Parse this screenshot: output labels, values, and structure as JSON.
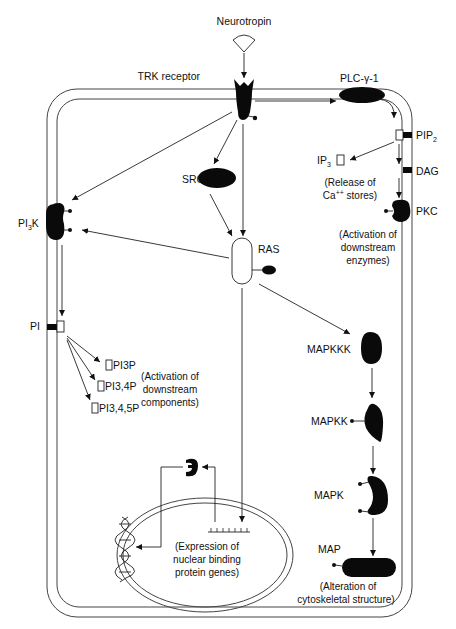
{
  "diagram": {
    "ligand": {
      "label": "Neurotropin"
    },
    "receptor": {
      "label": "TRK receptor"
    },
    "plc": {
      "label": "PLC-γ-1"
    },
    "pip2": {
      "label": "PIP",
      "sub": "2"
    },
    "ip3": {
      "label": "IP",
      "sub": "3"
    },
    "dag": {
      "label": "DAG"
    },
    "pkc": {
      "label": "PKC"
    },
    "ca_note": {
      "line1": "(Release of",
      "line2": "Ca",
      "sup": "++",
      "line2b": " stores)"
    },
    "pkc_note": {
      "line1": "(Activation of",
      "line2": "downstream",
      "line3": "enzymes)"
    },
    "src": {
      "label": "SRC"
    },
    "ras": {
      "label": "RAS"
    },
    "pi3k": {
      "label": "PI",
      "sub": "3",
      "label2": "K"
    },
    "pi": {
      "label": "PI"
    },
    "pi3p": {
      "label": "PI3P"
    },
    "pi34p": {
      "label": "PI3,4P"
    },
    "pi345p": {
      "label": "PI3,4,5P"
    },
    "pi_note": {
      "line1": "(Activation of",
      "line2": "downstream",
      "line3": "components)"
    },
    "mapkkk": {
      "label": "MAPKKK"
    },
    "mapkk": {
      "label": "MAPKK"
    },
    "mapk": {
      "label": "MAPK"
    },
    "map": {
      "label": "MAP"
    },
    "map_note": {
      "line1": "(Alteration of",
      "line2": "cytoskeletal structure)"
    },
    "nucleus_note": {
      "line1": "(Expression of",
      "line2": "nuclear binding",
      "line3": "protein genes)"
    }
  },
  "colors": {
    "ink": "#0a0a0a",
    "membrane": "#444444",
    "background": "#ffffff"
  }
}
